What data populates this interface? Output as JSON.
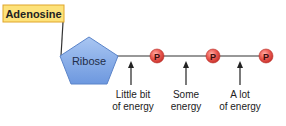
{
  "diagram": {
    "title_box": {
      "label": "Adenosine",
      "fill": "#fde27a",
      "border": "#e0a62a"
    },
    "sugar": {
      "label": "Ribose",
      "fill": "#7ea7e6",
      "border": "#5b84c9"
    },
    "phosphates": [
      {
        "label": "P"
      },
      {
        "label": "P"
      },
      {
        "label": "P"
      }
    ],
    "phosphate_color": "#e8504a",
    "bond_annotations": [
      {
        "line1": "Little bit",
        "line2": "of energy"
      },
      {
        "line1": "Some",
        "line2": "energy"
      },
      {
        "line1": "A lot",
        "line2": "of energy"
      }
    ]
  }
}
